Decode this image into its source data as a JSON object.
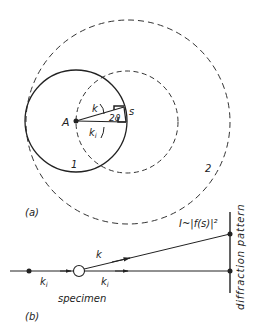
{
  "panel_a": {
    "label": "(a)",
    "point_A": "A",
    "vector_k": "k",
    "vector_ki": "k",
    "vector_ki_sub": "i",
    "angle": "2ϑ",
    "vector_s": "s",
    "circle_1": "1",
    "circle_2": "2"
  },
  "panel_b": {
    "label": "(b)",
    "intensity": "I~|f(s)|²",
    "screen_label": "diffraction pattern",
    "vector_k": "k",
    "vector_ki_left": "k",
    "vector_ki_right": "k",
    "sub_i": "i",
    "specimen": "specimen"
  },
  "colors": {
    "ink": "#222222",
    "background": "#ffffff"
  }
}
